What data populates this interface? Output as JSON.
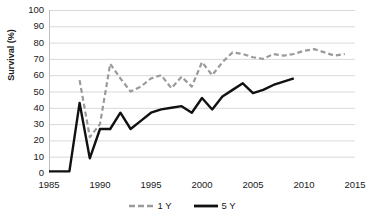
{
  "chart_data": {
    "type": "line",
    "title": "",
    "xlabel": "",
    "ylabel": "Survival (%)",
    "xlim": [
      1985,
      2015
    ],
    "ylim": [
      0,
      100
    ],
    "grid": true,
    "legend_position": "bottom",
    "xticks": [
      1985,
      1990,
      1995,
      2000,
      2005,
      2010,
      2015
    ],
    "yticks": [
      0,
      10,
      20,
      30,
      40,
      50,
      60,
      70,
      80,
      90,
      100
    ],
    "series": [
      {
        "name": "1 Y",
        "style": "dashed",
        "color": "#9a9a9a",
        "x": [
          1988,
          1989,
          1990,
          1991,
          1992,
          1993,
          1994,
          1995,
          1996,
          1997,
          1998,
          1999,
          2000,
          2001,
          2002,
          2003,
          2004,
          2005,
          2006,
          2007,
          2008,
          2009,
          2010,
          2011,
          2012,
          2013,
          2014
        ],
        "values": [
          57,
          22,
          30,
          67,
          58,
          50,
          53,
          58,
          60,
          52,
          59,
          53,
          68,
          60,
          68,
          74,
          73,
          71,
          70,
          73,
          72,
          73,
          75,
          76,
          74,
          72,
          73
        ]
      },
      {
        "name": "5 Y",
        "style": "solid",
        "color": "#111111",
        "x": [
          1985,
          1986,
          1987,
          1988,
          1989,
          1990,
          1991,
          1992,
          1993,
          1994,
          1995,
          1996,
          1997,
          1998,
          1999,
          2000,
          2001,
          2002,
          2003,
          2004,
          2005,
          2006,
          2007,
          2008,
          2009
        ],
        "values": [
          1,
          1,
          1,
          43,
          9,
          27,
          27,
          37,
          27,
          32,
          37,
          39,
          40,
          41,
          37,
          46,
          39,
          47,
          51,
          55,
          49,
          51,
          54,
          56,
          58
        ]
      }
    ]
  },
  "axis": {
    "y_title": "Survival (%)",
    "y_labels": [
      "100",
      "90",
      "80",
      "70",
      "60",
      "50",
      "40",
      "30",
      "20",
      "10",
      "0"
    ],
    "x_labels": [
      "1985",
      "1990",
      "1995",
      "2000",
      "2005",
      "2010",
      "2015"
    ]
  },
  "legend": {
    "items": [
      {
        "label": "1 Y",
        "color": "#9a9a9a",
        "style": "dashed"
      },
      {
        "label": "5 Y",
        "color": "#111111",
        "style": "solid"
      }
    ]
  },
  "colors": {
    "gridline": "#d9d9d9",
    "axis": "#bfbfbf",
    "text": "#1a1a1a",
    "series_1y": "#9a9a9a",
    "series_5y": "#111111"
  }
}
